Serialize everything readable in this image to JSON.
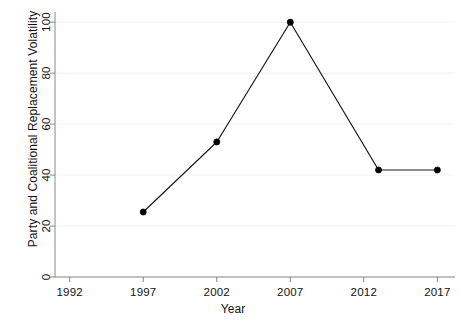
{
  "chart_data": {
    "type": "line",
    "title": "",
    "subtitle": "",
    "xlabel": "Year",
    "ylabel": "Party and Coalitional Replacement Volatility",
    "x": [
      1997,
      2002,
      2007,
      2013,
      2017
    ],
    "values": [
      25.5,
      53,
      100,
      42,
      42
    ],
    "series": [
      {
        "name": "Party and Coalitional Replacement Volatility",
        "values": [
          25.5,
          53,
          100,
          42,
          42
        ]
      }
    ],
    "xlim": [
      1991,
      2018.2
    ],
    "ylim": [
      0,
      104
    ],
    "xticks": [
      1992,
      1997,
      2002,
      2007,
      2012,
      2017
    ],
    "xticklabels": [
      "1992",
      "1997",
      "2002",
      "2007",
      "2012",
      "2017"
    ],
    "yticks": [
      0,
      20,
      40,
      60,
      80,
      100
    ],
    "yticklabels": [
      "0",
      "20",
      "40",
      "60",
      "80",
      "100"
    ],
    "grid": "horizontal-faint",
    "legend": null,
    "legend_position": "none",
    "line_color": "#1a1a1a",
    "marker": "circle",
    "marker_color": "#000000",
    "background_color": "#ffffff",
    "axis_color": "#888888",
    "gridline_color": "#f2f2f4"
  }
}
